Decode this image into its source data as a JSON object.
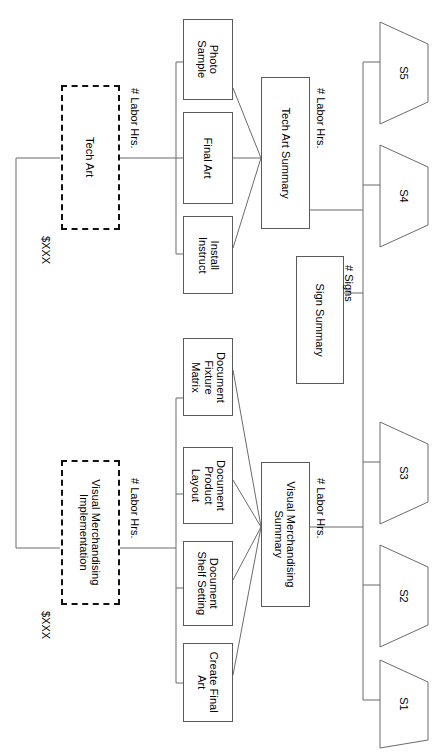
{
  "diagram": {
    "orientation": "rotated-90",
    "branches": [
      {
        "id": "tech-art",
        "cost_label": "$XXX",
        "phase_label": "Tech Art",
        "driver_label_left": "# Labor Hrs.",
        "driver_label_right": "# Labor Hrs.",
        "tasks": [
          "Photo\nSample",
          "Final Art",
          "Install\nInstruct"
        ],
        "summary": "Tech Art Summary"
      },
      {
        "id": "visual-merch",
        "cost_label": "$XXX",
        "phase_label": "Visual Merchandising\nImplementation",
        "driver_label_left": "# Labor Hrs.",
        "driver_label_right": "# Labor Hrs.",
        "tasks": [
          "Document\nFixture\nMatrix",
          "Document\nProduct\nLayout",
          "Document\nShelf Setting",
          "Create Final\nArt"
        ],
        "summary": "Visual Merchandising\nSummary"
      }
    ],
    "sign_summary": {
      "label": "Sign Summary",
      "driver_label": "# Signs"
    },
    "stores": [
      {
        "id": "s5",
        "label": "S5"
      },
      {
        "id": "s4",
        "label": "S4"
      },
      {
        "id": "s3",
        "label": "S3"
      },
      {
        "id": "s2",
        "label": "S2"
      },
      {
        "id": "s1",
        "label": "S1"
      }
    ],
    "colors": {
      "line": "#6b6b6b",
      "box_border": "#5a5a5a",
      "dash_border": "#111111",
      "background": "#ffffff",
      "text": "#000000"
    }
  }
}
